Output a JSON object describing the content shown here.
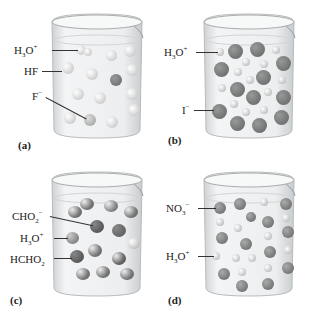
{
  "figure": {
    "panels": [
      {
        "id": "a",
        "tag": "(a)",
        "labels": [
          {
            "base": "H",
            "sub": "3",
            "rest": "O",
            "sup": "+"
          },
          {
            "base": "HF",
            "sub": "",
            "rest": "",
            "sup": ""
          },
          {
            "base": "F",
            "sub": "",
            "rest": "",
            "sup": "−"
          }
        ],
        "description": "Weak acid HF in water: mostly intact HF molecules, few H3O+ and F− ions"
      },
      {
        "id": "b",
        "tag": "(b)",
        "labels": [
          {
            "base": "H",
            "sub": "3",
            "rest": "O",
            "sup": "+"
          },
          {
            "base": "I",
            "sub": "",
            "rest": "",
            "sup": "−"
          }
        ],
        "description": "Strong acid HI in water: fully ionized into H3O+ and I− ions"
      },
      {
        "id": "c",
        "tag": "(c)",
        "labels": [
          {
            "base": "CHO",
            "sub": "2",
            "rest": "",
            "sup": "−"
          },
          {
            "base": "H",
            "sub": "3",
            "rest": "O",
            "sup": "+"
          },
          {
            "base": "HCHO",
            "sub": "2",
            "rest": "",
            "sup": ""
          }
        ],
        "description": "Weak acid HCHO2 in water: mostly intact formic acid molecules"
      },
      {
        "id": "d",
        "tag": "(d)",
        "labels": [
          {
            "base": "NO",
            "sub": "3",
            "rest": "",
            "sup": "−"
          },
          {
            "base": "H",
            "sub": "3",
            "rest": "O",
            "sup": "+"
          }
        ],
        "description": "Strong acid HNO3 in water: fully ionized into H3O+ and NO3− ions"
      }
    ],
    "colors": {
      "beaker_glass": "#e6e8ea",
      "liquid": "#eef0f1",
      "light_molecule": "#d4d6d6",
      "dark_molecule": "#6d6f6f",
      "label_text": "#222222"
    }
  }
}
